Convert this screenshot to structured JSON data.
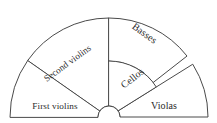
{
  "diagram": {
    "type": "sector-fan",
    "background_color": "#ffffff",
    "stroke_color": "#4a4a4a",
    "text_color": "#2b2b2b",
    "geometry": {
      "center_x": 109,
      "center_y": 117,
      "outer_radius": 99,
      "hub_radius": 11,
      "inner_band_radius": 56,
      "sweep_degrees": 180
    },
    "sections": [
      {
        "id": "first-violins",
        "label": "First violins",
        "start_angle": 180,
        "end_angle": 145,
        "inner_radius": 11,
        "outer_radius": 99,
        "label_x": 55,
        "label_y": 107,
        "label_rotation": 0
      },
      {
        "id": "second-violins",
        "label": "Second violins",
        "start_angle": 145,
        "end_angle": 90,
        "inner_radius": 11,
        "outer_radius": 99,
        "label_x": 68,
        "label_y": 64,
        "label_rotation": -36
      },
      {
        "id": "basses",
        "label": "Basses",
        "start_angle": 90,
        "end_angle": 38,
        "inner_radius": 56,
        "outer_radius": 99,
        "label_x": 144,
        "label_y": 34,
        "label_rotation": 36
      },
      {
        "id": "cellos",
        "label": "Cellos",
        "start_angle": 90,
        "end_angle": 32,
        "inner_radius": 11,
        "outer_radius": 56,
        "label_x": 133,
        "label_y": 79,
        "label_rotation": -38
      },
      {
        "id": "violas",
        "label": "Violas",
        "start_angle": 32,
        "end_angle": 0,
        "inner_radius": 11,
        "outer_radius": 99,
        "label_x": 164,
        "label_y": 107,
        "label_rotation": 0
      }
    ]
  }
}
